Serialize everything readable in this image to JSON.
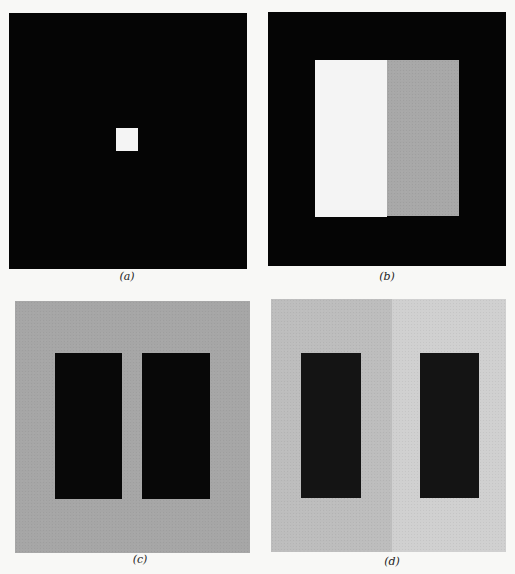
{
  "figure": {
    "panels": [
      {
        "id": "a",
        "caption": "(a)",
        "description": "Small white square on black background",
        "background_color": "#050505",
        "shapes": [
          {
            "name": "white-square",
            "color": "#f4f4f4"
          }
        ]
      },
      {
        "id": "b",
        "caption": "(b)",
        "description": "Rectangle split white/gray on black background",
        "background_color": "#050505",
        "shapes": [
          {
            "name": "white-half",
            "color": "#f4f4f4"
          },
          {
            "name": "gray-half",
            "color": "#a8a8a8"
          }
        ]
      },
      {
        "id": "c",
        "caption": "(c)",
        "description": "Two black bars on uniform gray background",
        "background_color": "#a6a6a6",
        "shapes": [
          {
            "name": "black-bar-left",
            "color": "#080808"
          },
          {
            "name": "black-bar-right",
            "color": "#080808"
          }
        ]
      },
      {
        "id": "d",
        "caption": "(d)",
        "description": "Two dark bars on background split into darker left and lighter right gray",
        "background_left_color": "#bdbdbd",
        "background_right_color": "#d0d0d0",
        "shapes": [
          {
            "name": "dark-bar-left",
            "color": "#141414"
          },
          {
            "name": "dark-bar-right",
            "color": "#141414"
          }
        ]
      }
    ]
  },
  "cut_off_text": ""
}
